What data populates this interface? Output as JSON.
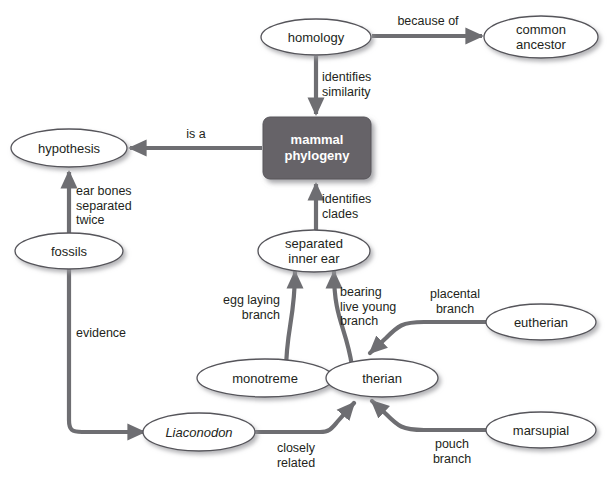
{
  "diagram": {
    "background_color": "#ffffff",
    "edge_color": "#6e6e72",
    "node_fill": "#ffffff",
    "node_stroke": "#55545a",
    "box_fill": "#666468",
    "box_text_color": "#ffffff",
    "text_color": "#231f20",
    "nodes": [
      {
        "id": "homology",
        "label": "homology",
        "shape": "ellipse",
        "italic": false
      },
      {
        "id": "common-ancestor",
        "label": "common\nancestor",
        "shape": "ellipse",
        "italic": false
      },
      {
        "id": "mammal-phylogeny",
        "label": "mammal\nphylogeny",
        "shape": "rounded-box",
        "italic": false
      },
      {
        "id": "hypothesis",
        "label": "hypothesis",
        "shape": "ellipse",
        "italic": false
      },
      {
        "id": "fossils",
        "label": "fossils",
        "shape": "ellipse",
        "italic": false
      },
      {
        "id": "separated-inner-ear",
        "label": "separated\ninner ear",
        "shape": "ellipse",
        "italic": false
      },
      {
        "id": "monotreme",
        "label": "monotreme",
        "shape": "ellipse",
        "italic": false
      },
      {
        "id": "therian",
        "label": "therian",
        "shape": "ellipse",
        "italic": false
      },
      {
        "id": "eutherian",
        "label": "eutherian",
        "shape": "ellipse",
        "italic": false
      },
      {
        "id": "marsupial",
        "label": "marsupial",
        "shape": "ellipse",
        "italic": false
      },
      {
        "id": "liaconodon",
        "label": "Liaconodon",
        "shape": "ellipse",
        "italic": true
      }
    ],
    "edges": [
      {
        "id": "homology-common-ancestor",
        "label": "because of",
        "from": "homology",
        "to": "common-ancestor"
      },
      {
        "id": "homology-mammal-phylogeny",
        "label": "identifies\nsimilarity",
        "from": "homology",
        "to": "mammal-phylogeny"
      },
      {
        "id": "mammal-phylogeny-hypothesis",
        "label": "is a",
        "from": "mammal-phylogeny",
        "to": "hypothesis"
      },
      {
        "id": "fossils-hypothesis",
        "label": "ear bones\nseparated\ntwice",
        "from": "fossils",
        "to": "hypothesis"
      },
      {
        "id": "separated-inner-ear-mammal-phylogeny",
        "label": "identifies\nclades",
        "from": "separated-inner-ear",
        "to": "mammal-phylogeny"
      },
      {
        "id": "monotreme-separated-inner-ear",
        "label": "egg laying\nbranch",
        "from": "monotreme",
        "to": "separated-inner-ear"
      },
      {
        "id": "therian-separated-inner-ear",
        "label": "bearing\nlive young\nbranch",
        "from": "therian",
        "to": "separated-inner-ear"
      },
      {
        "id": "eutherian-therian",
        "label": "placental\nbranch",
        "from": "eutherian",
        "to": "therian"
      },
      {
        "id": "marsupial-therian",
        "label": "pouch\nbranch",
        "from": "marsupial",
        "to": "therian"
      },
      {
        "id": "fossils-liaconodon",
        "label": "evidence",
        "from": "fossils",
        "to": "liaconodon"
      },
      {
        "id": "liaconodon-therian",
        "label": "closely\nrelated",
        "from": "liaconodon",
        "to": "therian"
      }
    ]
  }
}
